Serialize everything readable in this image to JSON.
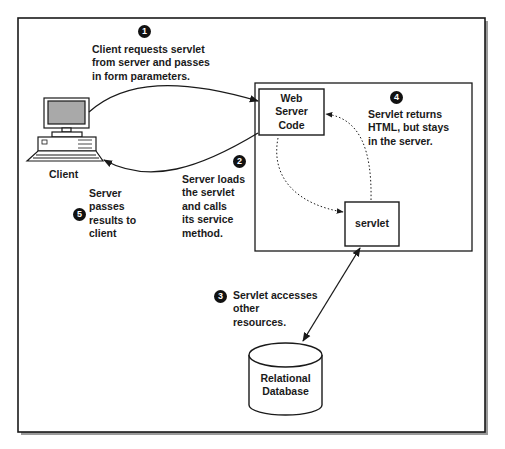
{
  "diagram": {
    "nodes": {
      "client": {
        "label": "Client",
        "icon": "desktop-computer-icon"
      },
      "web_server_code": {
        "lines": [
          "Web",
          "Server",
          "Code"
        ]
      },
      "servlet": {
        "label": "servlet"
      },
      "database": {
        "lines": [
          "Relational",
          "Database"
        ],
        "icon": "database-cylinder-icon"
      }
    },
    "steps": [
      {
        "number": "1",
        "lines": [
          "Client requests servlet",
          "from server and passes",
          "in form parameters."
        ]
      },
      {
        "number": "2",
        "lines": [
          "Server loads",
          "the servlet",
          "and calls",
          "its service",
          "method."
        ]
      },
      {
        "number": "3",
        "lines": [
          "Servlet accesses",
          "other",
          "resources."
        ]
      },
      {
        "number": "4",
        "lines": [
          "Servlet returns",
          "HTML, but stays",
          "in the server."
        ]
      },
      {
        "number": "5",
        "lines": [
          "Server",
          "passes",
          "results to",
          "client"
        ]
      }
    ],
    "edges": [
      {
        "from": "client",
        "to": "web_server_code",
        "style": "solid",
        "step": "1"
      },
      {
        "from": "web_server_code",
        "to": "servlet",
        "style": "dotted",
        "step": "2"
      },
      {
        "from": "servlet",
        "to": "database",
        "style": "solid-bidirectional",
        "step": "3"
      },
      {
        "from": "servlet",
        "to": "web_server_code",
        "style": "dotted",
        "step": "4"
      },
      {
        "from": "web_server_code",
        "to": "client",
        "style": "solid",
        "step": "5"
      }
    ],
    "colors": {
      "stroke": "#1a1a1a",
      "shadow": "#9a9a9a",
      "screen": "#a9a9a9",
      "badge": "#111111"
    }
  }
}
